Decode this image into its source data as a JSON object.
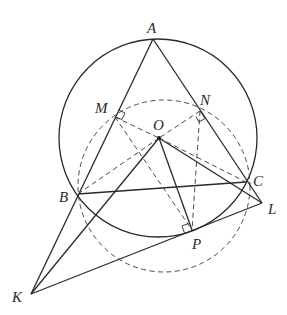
{
  "diagram": {
    "type": "geometry",
    "points": {
      "A": {
        "label": "A",
        "x": 153,
        "y": 39
      },
      "B": {
        "label": "B",
        "x": 78,
        "y": 194
      },
      "C": {
        "label": "C",
        "x": 246,
        "y": 182
      },
      "O": {
        "label": "O",
        "x": 159,
        "y": 138
      },
      "M": {
        "label": "M",
        "x": 115,
        "y": 117
      },
      "N": {
        "label": "N",
        "x": 200,
        "y": 111
      },
      "P": {
        "label": "P",
        "x": 192,
        "y": 230
      },
      "K": {
        "label": "K",
        "x": 31,
        "y": 294
      },
      "L": {
        "label": "L",
        "x": 262,
        "y": 203
      }
    },
    "labels": [
      "A",
      "M",
      "N",
      "O",
      "B",
      "C",
      "L",
      "P",
      "K"
    ],
    "circles": [
      {
        "name": "circumcircle",
        "center": "O",
        "style": "solid"
      },
      {
        "name": "dashed-circle",
        "style": "dashed",
        "through": [
          "M",
          "N",
          "B",
          "C",
          "P"
        ]
      }
    ],
    "right_angles": [
      "M",
      "N",
      "P"
    ],
    "solid_segments": [
      "A-K",
      "A-L",
      "B-C",
      "O-K",
      "O-P",
      "O-L",
      "K-L"
    ],
    "dashed_segments": [
      "M-O",
      "N-O",
      "B-O",
      "O-C",
      "M-P",
      "N-P"
    ]
  }
}
